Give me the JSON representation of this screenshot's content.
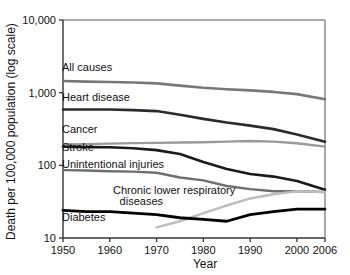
{
  "chart_data": {
    "type": "line",
    "title": "",
    "xlabel": "Year",
    "ylabel": "Death per 100,000 population (log scale)",
    "yscale": "log",
    "ylim": [
      10,
      10000
    ],
    "xlim": [
      1950,
      2006
    ],
    "grid": false,
    "legend_position": "inline-labels",
    "ytick_labels": [
      "10,000",
      "1,000",
      "100",
      "10"
    ],
    "ytick_values": [
      10000,
      1000,
      100,
      10
    ],
    "xtick_labels": [
      "1950",
      "1960",
      "1970",
      "1980",
      "1990",
      "2000",
      "2006"
    ],
    "xtick_values": [
      1950,
      1960,
      1970,
      1980,
      1990,
      2000,
      2006
    ],
    "x": [
      1950,
      1955,
      1960,
      1965,
      1970,
      1975,
      1980,
      1985,
      1990,
      1995,
      2000,
      2006
    ],
    "series": [
      {
        "name": "All causes",
        "color": "#777777",
        "width": 2.6,
        "label": "All causes",
        "label_x": 62,
        "label_y": 71,
        "values": [
          1446,
          1418,
          1399,
          1377,
          1341,
          1250,
          1166,
          1114,
          1075,
          1024,
          954,
          810
        ]
      },
      {
        "name": "Heart disease",
        "color": "#2b2b2b",
        "width": 2.6,
        "label": "Heart disease",
        "label_x": 62,
        "label_y": 101,
        "values": [
          587,
          588,
          586,
          575,
          558,
          496,
          436,
          388,
          352,
          315,
          266,
          211
        ]
      },
      {
        "name": "Cancer",
        "color": "#9a9a9a",
        "width": 2.4,
        "label": "Cancer",
        "label_x": 62,
        "label_y": 133,
        "values": [
          194,
          196,
          199,
          202,
          204,
          206,
          208,
          212,
          216,
          212,
          201,
          181
        ]
      },
      {
        "name": "Stroke",
        "color": "#1a1a1a",
        "width": 2.6,
        "label": "Stroke",
        "label_x": 62,
        "label_y": 151,
        "values": [
          181,
          178,
          177,
          172,
          162,
          143,
          111,
          89,
          76,
          70,
          61,
          46
        ]
      },
      {
        "name": "Unintentional injuries",
        "color": "#6e6e6e",
        "width": 2.4,
        "label": "Unintentional injuries",
        "label_x": 62,
        "label_y": 168,
        "values": [
          86,
          85,
          83,
          82,
          79,
          68,
          62,
          52,
          47,
          44,
          44,
          43
        ]
      },
      {
        "name": "Chronic lower respiratory diseases",
        "color": "#bdbdbd",
        "width": 2.4,
        "label_line1": "Chronic lower respiratory",
        "label_line2": "diseases",
        "label_x": 113,
        "label_y": 194,
        "label2_x": 163,
        "label2_y": 205,
        "values": [
          null,
          null,
          null,
          null,
          14,
          17,
          22,
          28,
          35,
          40,
          44,
          43
        ]
      },
      {
        "name": "Diabetes",
        "color": "#000000",
        "width": 2.8,
        "label": "Diabetes",
        "label_x": 62,
        "label_y": 221,
        "values": [
          24,
          23,
          23,
          22,
          21,
          19,
          18,
          17,
          21,
          23,
          25,
          25
        ]
      }
    ]
  },
  "axes": {
    "y_title": "Death per 100,000 population (log scale)",
    "x_title": "Year"
  }
}
